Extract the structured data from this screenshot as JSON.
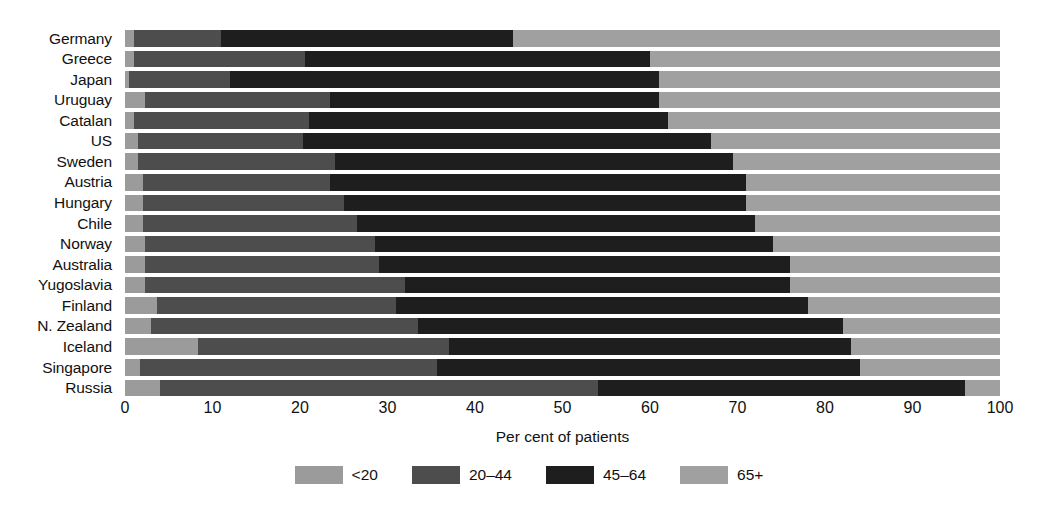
{
  "chart_data": {
    "type": "bar",
    "orientation": "horizontal",
    "stacked": true,
    "normalized_percent": true,
    "title": "",
    "xlabel": "Per cent of patients",
    "ylabel": "",
    "xlim": [
      0,
      100
    ],
    "xticks": [
      0,
      10,
      20,
      30,
      40,
      50,
      60,
      70,
      80,
      90,
      100
    ],
    "grid": false,
    "legend_position": "bottom",
    "categories": [
      "Germany",
      "Greece",
      "Japan",
      "Uruguay",
      "Catalan",
      "US",
      "Sweden",
      "Austria",
      "Hungary",
      "Chile",
      "Norway",
      "Australia",
      "Yugoslavia",
      "Finland",
      "N. Zealand",
      "Iceland",
      "Singapore",
      "Russia"
    ],
    "series": [
      {
        "name": "<20",
        "color": "#9b9b9b",
        "values": [
          1,
          1,
          0.5,
          2.3,
          1,
          1.5,
          1.5,
          2,
          2,
          2,
          2.3,
          2.3,
          2.3,
          3.7,
          3,
          8.3,
          1.7,
          4
        ]
      },
      {
        "name": "20–44",
        "color": "#4d4d4d",
        "values": [
          10,
          19.6,
          11.5,
          21.1,
          20,
          18.8,
          22.5,
          21.4,
          23,
          24.5,
          26.3,
          26.7,
          29.7,
          27.3,
          30.5,
          28.7,
          33.9,
          50
        ]
      },
      {
        "name": "45–64",
        "color": "#1e1e1e",
        "values": [
          33.3,
          39.4,
          49,
          37.6,
          41,
          46.7,
          45.5,
          47.6,
          46,
          45.5,
          45.4,
          47,
          44,
          47,
          48.5,
          46,
          48.4,
          42
        ]
      },
      {
        "name": "65+",
        "color": "#a0a0a0",
        "values": [
          55.7,
          40,
          39,
          39,
          38,
          33,
          30.5,
          29,
          29,
          28,
          26,
          24,
          24,
          22,
          18,
          17,
          16,
          4
        ]
      }
    ],
    "segment_cumulative_ends": {
      "Germany": [
        1,
        11,
        44.3,
        100
      ],
      "Greece": [
        1,
        20.6,
        60,
        100
      ],
      "Japan": [
        0.5,
        12,
        61,
        100
      ],
      "Uruguay": [
        2.3,
        23.4,
        61,
        100
      ],
      "Catalan": [
        1,
        21,
        62,
        100
      ],
      "US": [
        1.5,
        20.3,
        67,
        100
      ],
      "Sweden": [
        1.5,
        24,
        69.5,
        100
      ],
      "Austria": [
        2,
        23.4,
        71,
        100
      ],
      "Hungary": [
        2,
        25,
        71,
        100
      ],
      "Chile": [
        2,
        26.5,
        72,
        100
      ],
      "Norway": [
        2.3,
        28.6,
        74,
        100
      ],
      "Australia": [
        2.3,
        29,
        76,
        100
      ],
      "Yugoslavia": [
        2.3,
        32,
        76,
        100
      ],
      "Finland": [
        3.7,
        31,
        78,
        100
      ],
      "N. Zealand": [
        3,
        33.5,
        82,
        100
      ],
      "Iceland": [
        8.3,
        37,
        83,
        100
      ],
      "Singapore": [
        1.7,
        35.6,
        84,
        100
      ],
      "Russia": [
        4,
        54,
        96,
        100
      ]
    }
  },
  "axis": {
    "xtick_labels": [
      "0",
      "10",
      "20",
      "30",
      "40",
      "50",
      "60",
      "70",
      "80",
      "90",
      "100"
    ],
    "xtitle": "Per cent of patients"
  },
  "legend": {
    "items": [
      {
        "label": "<20",
        "color": "#9b9b9b"
      },
      {
        "label": "20–44",
        "color": "#4d4d4d"
      },
      {
        "label": "45–64",
        "color": "#1e1e1e"
      },
      {
        "label": "65+",
        "color": "#a0a0a0"
      }
    ]
  }
}
